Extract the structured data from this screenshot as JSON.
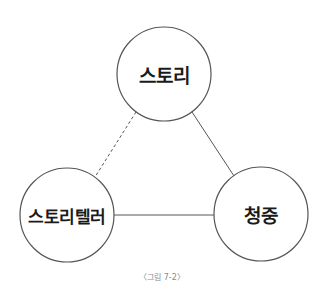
{
  "diagram": {
    "type": "triangle-relationship",
    "nodes": [
      {
        "id": "story",
        "label": "스토리",
        "cx": 164,
        "cy": 74,
        "r": 47
      },
      {
        "id": "storyteller",
        "label": "스토리텔러",
        "cx": 67,
        "cy": 215,
        "r": 47
      },
      {
        "id": "audience",
        "label": "청중",
        "cx": 261,
        "cy": 214,
        "r": 47
      }
    ],
    "edges": [
      {
        "from": "story",
        "to": "storyteller",
        "style": "dashed"
      },
      {
        "from": "story",
        "to": "audience",
        "style": "solid"
      },
      {
        "from": "storyteller",
        "to": "audience",
        "style": "solid"
      }
    ],
    "colors": {
      "stroke": "#555555",
      "text": "#1a1a1a",
      "caption": "#8a8a8a"
    }
  },
  "caption": "〈그림 7-2〉"
}
